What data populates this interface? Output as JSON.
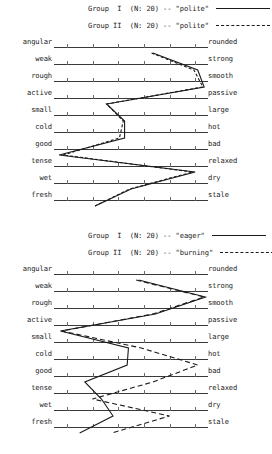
{
  "page": {
    "scale_points": 7
  },
  "charts": [
    {
      "id": "chart-1",
      "legend": [
        {
          "text": "Group  I  (N: 20) -- \"polite\"",
          "line_style": "solid",
          "group": "Group I",
          "n": 20,
          "concept": "polite"
        },
        {
          "text": "Group II  (N: 20) -- \"polite\"",
          "line_style": "dashed",
          "group": "Group II",
          "n": 20,
          "concept": "polite"
        }
      ],
      "rows": [
        {
          "left": "angular",
          "right": "rounded"
        },
        {
          "left": "weak",
          "right": "strong"
        },
        {
          "left": "rough",
          "right": "smooth"
        },
        {
          "left": "active",
          "right": "passive"
        },
        {
          "left": "small",
          "right": "large"
        },
        {
          "left": "cold",
          "right": "hot"
        },
        {
          "left": "good",
          "right": "bad"
        },
        {
          "left": "tense",
          "right": "relaxed"
        },
        {
          "left": "wet",
          "right": "dry"
        },
        {
          "left": "fresh",
          "right": "stale"
        }
      ]
    },
    {
      "id": "chart-2",
      "legend": [
        {
          "text": "Group  I  (N: 20) -- \"eager\"",
          "line_style": "solid",
          "group": "Group I",
          "n": 20,
          "concept": "eager"
        },
        {
          "text": "Group II  (N: 20) -- \"burning\"",
          "line_style": "dashed-wide",
          "group": "Group II",
          "n": 20,
          "concept": "burning"
        }
      ],
      "rows": [
        {
          "left": "angular",
          "right": "rounded"
        },
        {
          "left": "weak",
          "right": "strong"
        },
        {
          "left": "rough",
          "right": "smooth"
        },
        {
          "left": "active",
          "right": "passive"
        },
        {
          "left": "small",
          "right": "large"
        },
        {
          "left": "cold",
          "right": "hot"
        },
        {
          "left": "good",
          "right": "bad"
        },
        {
          "left": "tense",
          "right": "relaxed"
        },
        {
          "left": "wet",
          "right": "dry"
        },
        {
          "left": "fresh",
          "right": "stale"
        }
      ]
    }
  ],
  "chart_data": [
    {
      "type": "line",
      "title": "Group I / Group II -- \"polite\"",
      "orientation": "horizontal-profile",
      "xlabel": "",
      "ylabel": "",
      "xlim": [
        1,
        7
      ],
      "grid": false,
      "legend_position": "top-center",
      "categories": [
        "angular-rounded",
        "weak-strong",
        "rough-smooth",
        "active-passive",
        "small-large",
        "cold-hot",
        "good-bad",
        "tense-relaxed",
        "wet-dry",
        "fresh-stale"
      ],
      "series": [
        {
          "name": "Group I (N: 20) -- \"polite\"",
          "line_style": "solid",
          "values": [
            4.85,
            6.6,
            6.85,
            3.05,
            3.75,
            3.75,
            1.2,
            6.5,
            4.0,
            2.6
          ]
        },
        {
          "name": "Group II (N: 20) -- \"polite\"",
          "line_style": "dashed",
          "values": [
            4.8,
            6.45,
            6.8,
            3.05,
            3.7,
            3.55,
            1.35,
            6.4,
            3.95,
            2.6
          ]
        }
      ]
    },
    {
      "type": "line",
      "title": "Group I -- \"eager\" / Group II -- \"burning\"",
      "orientation": "horizontal-profile",
      "xlabel": "",
      "ylabel": "",
      "xlim": [
        1,
        7
      ],
      "grid": false,
      "legend_position": "top-center",
      "categories": [
        "angular-rounded",
        "weak-strong",
        "rough-smooth",
        "active-passive",
        "small-large",
        "cold-hot",
        "good-bad",
        "tense-relaxed",
        "wet-dry",
        "fresh-stale"
      ],
      "series": [
        {
          "name": "Group I (N: 20) -- \"eager\"",
          "line_style": "solid",
          "values": [
            4.3,
            6.9,
            4.95,
            1.25,
            3.9,
            3.85,
            2.2,
            2.85,
            3.3,
            2.0
          ]
        },
        {
          "name": "Group II (N: 20) -- \"burning\"",
          "line_style": "dashed-wide",
          "values": [
            4.2,
            6.85,
            4.85,
            1.3,
            4.4,
            6.6,
            4.85,
            2.5,
            5.5,
            3.25
          ]
        }
      ]
    }
  ]
}
